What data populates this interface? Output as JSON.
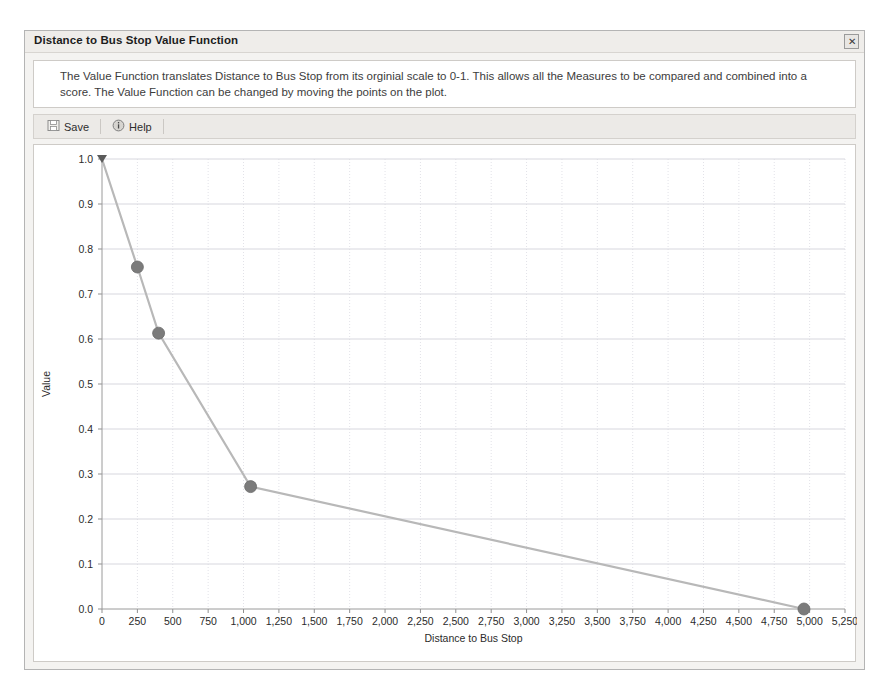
{
  "window": {
    "title": "Distance to Bus Stop Value Function",
    "close_label": "✕"
  },
  "description": {
    "text": "The Value Function translates Distance to Bus Stop from its orginial scale to 0-1. This allows all the Measures to be compared and combined into a score. The Value Function can be changed by moving the points on the plot."
  },
  "toolbar": {
    "save_label": "Save",
    "help_label": "Help",
    "save_icon": "save-disk-icon",
    "help_icon": "help-info-icon"
  },
  "chart_data": {
    "type": "line",
    "title": "",
    "xlabel": "Distance to Bus Stop",
    "ylabel": "Value",
    "xlim": [
      0,
      5250
    ],
    "ylim": [
      0,
      1.0
    ],
    "grid": true,
    "legend": false,
    "x_ticks": [
      0,
      250,
      500,
      750,
      1000,
      1250,
      1500,
      1750,
      2000,
      2250,
      2500,
      2750,
      3000,
      3250,
      3500,
      3750,
      4000,
      4250,
      4500,
      4750,
      5000,
      5250
    ],
    "x_tick_labels": [
      "0",
      "250",
      "500",
      "750",
      "1,000",
      "1,250",
      "1,500",
      "1,750",
      "2,000",
      "2,250",
      "2,500",
      "2,750",
      "3,000",
      "3,250",
      "3,500",
      "3,750",
      "4,000",
      "4,250",
      "4,500",
      "4,750",
      "5,000",
      "5,250"
    ],
    "y_ticks": [
      0.0,
      0.1,
      0.2,
      0.3,
      0.4,
      0.5,
      0.6,
      0.7,
      0.8,
      0.9,
      1.0
    ],
    "y_tick_labels": [
      "0.0",
      "0.1",
      "0.2",
      "0.3",
      "0.4",
      "0.5",
      "0.6",
      "0.7",
      "0.8",
      "0.9",
      "1.0"
    ],
    "series": [
      {
        "name": "Value Function",
        "line_color": "#b8b8b8",
        "marker_color": "#7b7b7b",
        "x": [
          0,
          250,
          400,
          1050,
          4960
        ],
        "y": [
          1.0,
          0.76,
          0.613,
          0.272,
          0.0
        ]
      }
    ],
    "markers_visible": [
      false,
      true,
      true,
      true,
      true
    ]
  }
}
